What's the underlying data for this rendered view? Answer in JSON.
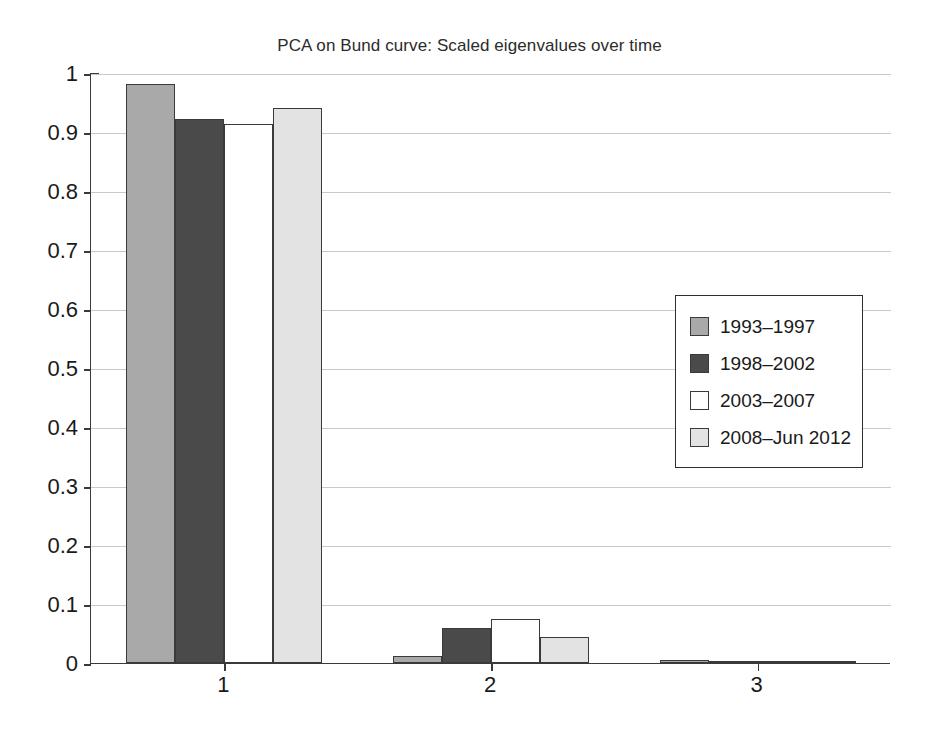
{
  "chart_data": {
    "type": "bar",
    "title": "PCA on Bund curve: Scaled eigenvalues over time",
    "xlabel": "",
    "ylabel": "",
    "categories": [
      "1",
      "2",
      "3"
    ],
    "series": [
      {
        "name": "1993–1997",
        "color": "#a9a9a9",
        "values": [
          0.982,
          0.012,
          0.005
        ]
      },
      {
        "name": "1998–2002",
        "color": "#4a4a4a",
        "values": [
          0.922,
          0.06,
          0.004
        ]
      },
      {
        "name": "2003–2007",
        "color": "#ffffff",
        "values": [
          0.913,
          0.075,
          0.002
        ]
      },
      {
        "name": "2008–Jun 2012",
        "color": "#e3e3e3",
        "values": [
          0.94,
          0.044,
          0.002
        ]
      }
    ],
    "ylim": [
      0,
      1
    ],
    "yticks": [
      "0",
      "0.1",
      "0.2",
      "0.3",
      "0.4",
      "0.5",
      "0.6",
      "0.7",
      "0.8",
      "0.9",
      "1"
    ],
    "ytick_values": [
      0,
      0.1,
      0.2,
      0.3,
      0.4,
      0.5,
      0.6,
      0.7,
      0.8,
      0.9,
      1
    ],
    "xticks": [
      "1",
      "2",
      "3"
    ],
    "grid": "horizontal",
    "legend_position": "center-right",
    "legend_entries": [
      "1993–1997",
      "1998–2002",
      "2003–2007",
      "2008–Jun 2012"
    ],
    "axis_color": "#3a3a3a",
    "grid_color": "#c9c9c9",
    "background": "#ffffff"
  }
}
